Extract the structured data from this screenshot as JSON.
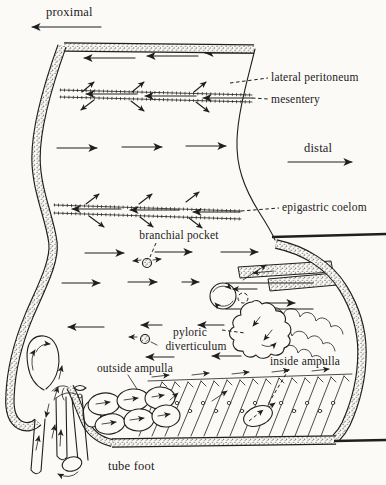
{
  "figure": {
    "labels": {
      "proximal": "proximal",
      "lateral_peritoneum": "lateral peritoneum",
      "mesentery": "mesentery",
      "distal": "distal",
      "epigastric_coelom": "epigastric coelom",
      "branchial_pocket": "branchial pocket",
      "pyloric": "pyloric",
      "diverticulum": "diverticulum",
      "outside_ampulla": "outside ampulla",
      "inside_ampulla": "inside ampulla",
      "tube_foot": "tube foot"
    },
    "colors": {
      "ink": "#1f1f1f",
      "paper": "#fbfaf7"
    }
  }
}
